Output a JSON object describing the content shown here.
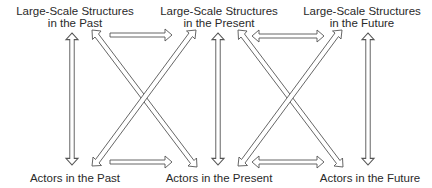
{
  "diagram": {
    "nodes": [
      {
        "id": "structures-past",
        "line1": "Large-Scale Structures",
        "line2": "in the Past",
        "x": 75,
        "y": 5
      },
      {
        "id": "structures-present",
        "line1": "Large-Scale Structures",
        "line2": "in the Present",
        "x": 219,
        "y": 5
      },
      {
        "id": "structures-future",
        "line1": "Large-Scale Structures",
        "line2": "in the Future",
        "x": 362,
        "y": 5
      },
      {
        "id": "actors-past",
        "line1": "Actors in the Past",
        "x": 75,
        "y": 172
      },
      {
        "id": "actors-present",
        "line1": "Actors in the Present",
        "x": 219,
        "y": 172
      },
      {
        "id": "actors-future",
        "line1": "Actors in the Future",
        "x": 370,
        "y": 172
      }
    ],
    "edges": [
      {
        "from": "structures-past",
        "to": "actors-past",
        "style": "double-headed"
      },
      {
        "from": "structures-present",
        "to": "actors-present",
        "style": "double-headed"
      },
      {
        "from": "structures-future",
        "to": "actors-future",
        "style": "double-headed"
      },
      {
        "from": "structures-past",
        "to": "structures-present",
        "style": "single-headed"
      },
      {
        "from": "actors-past",
        "to": "actors-present",
        "style": "single-headed"
      },
      {
        "from": "structures-past",
        "to": "actors-present",
        "style": "double-headed"
      },
      {
        "from": "actors-past",
        "to": "structures-present",
        "style": "double-headed"
      },
      {
        "from": "structures-present",
        "to": "structures-future",
        "style": "double-headed"
      },
      {
        "from": "actors-present",
        "to": "actors-future",
        "style": "double-headed"
      },
      {
        "from": "structures-present",
        "to": "actors-future",
        "style": "double-headed"
      },
      {
        "from": "actors-present",
        "to": "structures-future",
        "style": "double-headed"
      }
    ],
    "arrow_style": {
      "fill": "#ffffff",
      "stroke": "#555555"
    }
  }
}
